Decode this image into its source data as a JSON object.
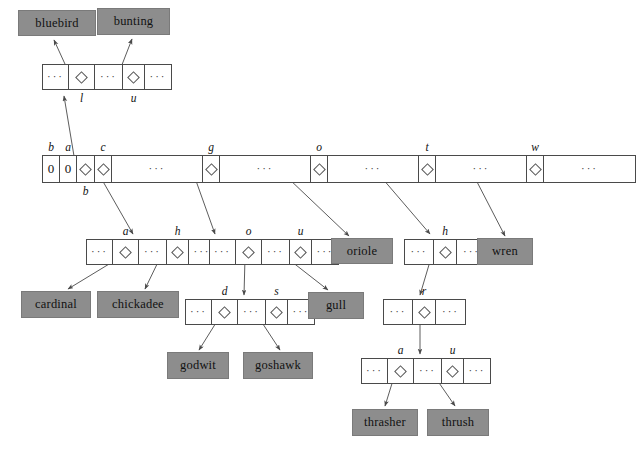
{
  "diagram": {
    "colors": {
      "leaf_fill": "#8d8d8d",
      "node_stroke": "#4a4a4a",
      "background": "#ffffff",
      "arrow": "#555555"
    },
    "ellipsis": "···",
    "zero": "0"
  },
  "leaves": [
    {
      "id": "bluebird",
      "label": "bluebird",
      "x": 18,
      "y": 10,
      "w": 78,
      "h": 26
    },
    {
      "id": "bunting",
      "label": "bunting",
      "x": 97,
      "y": 8,
      "w": 73,
      "h": 27
    },
    {
      "id": "oriole",
      "label": "oriole",
      "x": 331,
      "y": 238,
      "w": 62,
      "h": 26
    },
    {
      "id": "wren",
      "label": "wren",
      "x": 477,
      "y": 238,
      "w": 56,
      "h": 27
    },
    {
      "id": "cardinal",
      "label": "cardinal",
      "x": 21,
      "y": 291,
      "w": 70,
      "h": 27
    },
    {
      "id": "chickadee",
      "label": "chickadee",
      "x": 97,
      "y": 291,
      "w": 82,
      "h": 27
    },
    {
      "id": "gull",
      "label": "gull",
      "x": 308,
      "y": 292,
      "w": 56,
      "h": 27
    },
    {
      "id": "godwit",
      "label": "godwit",
      "x": 167,
      "y": 352,
      "w": 62,
      "h": 27
    },
    {
      "id": "goshawk",
      "label": "goshawk",
      "x": 243,
      "y": 352,
      "w": 70,
      "h": 27
    },
    {
      "id": "thrasher",
      "label": "thrasher",
      "x": 352,
      "y": 409,
      "w": 66,
      "h": 27
    },
    {
      "id": "thrush",
      "label": "thrush",
      "x": 427,
      "y": 409,
      "w": 62,
      "h": 27
    }
  ],
  "nodes": [
    {
      "id": "node-b",
      "x": 42,
      "y": 64,
      "h": 26,
      "cells": [
        {
          "type": "dots",
          "w": 26
        },
        {
          "type": "pointer",
          "w": 26,
          "label": "l",
          "label_pos": "below"
        },
        {
          "type": "dots",
          "w": 28
        },
        {
          "type": "pointer",
          "w": 22,
          "label": "u",
          "label_pos": "below"
        },
        {
          "type": "dots",
          "w": 26
        }
      ]
    },
    {
      "id": "node-root",
      "x": 42,
      "y": 155,
      "h": 28,
      "cells": [
        {
          "type": "zero",
          "w": 17,
          "label": "b",
          "label_pos": "above"
        },
        {
          "type": "zero",
          "w": 17,
          "label": "a",
          "label_pos": "above"
        },
        {
          "type": "pointer",
          "w": 18,
          "label": "b",
          "label_pos": "below"
        },
        {
          "type": "pointer",
          "w": 17,
          "label": "c",
          "label_pos": "above"
        },
        {
          "type": "dots",
          "w": 91
        },
        {
          "type": "pointer",
          "w": 17,
          "label": "g",
          "label_pos": "above"
        },
        {
          "type": "dots",
          "w": 91
        },
        {
          "type": "pointer",
          "w": 17,
          "label": "o",
          "label_pos": "above"
        },
        {
          "type": "dots",
          "w": 91
        },
        {
          "type": "pointer",
          "w": 17,
          "label": "t",
          "label_pos": "above"
        },
        {
          "type": "dots",
          "w": 91
        },
        {
          "type": "pointer",
          "w": 17,
          "label": "w",
          "label_pos": "above"
        },
        {
          "type": "dots",
          "w": 91
        }
      ]
    },
    {
      "id": "node-c",
      "x": 86,
      "y": 239,
      "h": 26,
      "cells": [
        {
          "type": "dots",
          "w": 26
        },
        {
          "type": "pointer",
          "w": 26,
          "label": "a",
          "label_pos": "above"
        },
        {
          "type": "dots",
          "w": 28
        },
        {
          "type": "pointer",
          "w": 22,
          "label": "h",
          "label_pos": "above"
        },
        {
          "type": "dots",
          "w": 26
        }
      ]
    },
    {
      "id": "node-g",
      "x": 209,
      "y": 239,
      "h": 26,
      "cells": [
        {
          "type": "dots",
          "w": 26
        },
        {
          "type": "pointer",
          "w": 26,
          "label": "o",
          "label_pos": "above"
        },
        {
          "type": "dots",
          "w": 28
        },
        {
          "type": "pointer",
          "w": 22,
          "label": "u",
          "label_pos": "above"
        },
        {
          "type": "dots",
          "w": 26
        }
      ]
    },
    {
      "id": "node-t",
      "x": 404,
      "y": 239,
      "h": 26,
      "cells": [
        {
          "type": "dots",
          "w": 29
        },
        {
          "type": "pointer",
          "w": 23,
          "label": "h",
          "label_pos": "above"
        },
        {
          "type": "dots",
          "w": 29
        }
      ]
    },
    {
      "id": "node-go",
      "x": 185,
      "y": 299,
      "h": 26,
      "cells": [
        {
          "type": "dots",
          "w": 26
        },
        {
          "type": "pointer",
          "w": 26,
          "label": "d",
          "label_pos": "above"
        },
        {
          "type": "dots",
          "w": 28
        },
        {
          "type": "pointer",
          "w": 22,
          "label": "s",
          "label_pos": "above"
        },
        {
          "type": "dots",
          "w": 26
        }
      ]
    },
    {
      "id": "node-th",
      "x": 383,
      "y": 299,
      "h": 26,
      "cells": [
        {
          "type": "dots",
          "w": 29
        },
        {
          "type": "pointer",
          "w": 23,
          "label": "r",
          "label_pos": "above"
        },
        {
          "type": "dots",
          "w": 29
        }
      ]
    },
    {
      "id": "node-thr",
      "x": 361,
      "y": 358,
      "h": 26,
      "cells": [
        {
          "type": "dots",
          "w": 26
        },
        {
          "type": "pointer",
          "w": 26,
          "label": "a",
          "label_pos": "above"
        },
        {
          "type": "dots",
          "w": 28
        },
        {
          "type": "pointer",
          "w": 22,
          "label": "u",
          "label_pos": "above"
        },
        {
          "type": "dots",
          "w": 26
        }
      ]
    }
  ],
  "edges": [
    {
      "id": "edge-b-to-node",
      "from": "root.b",
      "to": "node-b",
      "x1": 75,
      "y1": 162,
      "x2": 64,
      "y2": 96
    },
    {
      "id": "edge-l-to-bluebird",
      "from": "node-b.l",
      "to": "bluebird",
      "x1": 70,
      "y1": 75,
      "x2": 54,
      "y2": 40
    },
    {
      "id": "edge-u-to-bunting",
      "from": "node-b.u",
      "to": "bunting",
      "x1": 118,
      "y1": 75,
      "x2": 132,
      "y2": 39
    },
    {
      "id": "edge-c-to-node",
      "from": "root.c",
      "to": "node-c",
      "x1": 101,
      "y1": 178,
      "x2": 133,
      "y2": 234
    },
    {
      "id": "edge-g-to-node",
      "from": "root.g",
      "to": "node-g",
      "x1": 195,
      "y1": 178,
      "x2": 215,
      "y2": 234
    },
    {
      "id": "edge-o-to-oriole",
      "from": "root.o",
      "to": "oriole",
      "x1": 288,
      "y1": 178,
      "x2": 349,
      "y2": 236
    },
    {
      "id": "edge-t-to-node",
      "from": "root.t",
      "to": "node-t",
      "x1": 382,
      "y1": 178,
      "x2": 430,
      "y2": 234
    },
    {
      "id": "edge-w-to-wren",
      "from": "root.w",
      "to": "wren",
      "x1": 475,
      "y1": 178,
      "x2": 505,
      "y2": 236
    },
    {
      "id": "edge-a-to-cardinal",
      "from": "node-c.a",
      "to": "cardinal",
      "x1": 119,
      "y1": 258,
      "x2": 68,
      "y2": 289
    },
    {
      "id": "edge-h-to-chickadee",
      "from": "node-c.h",
      "to": "chickadee",
      "x1": 160,
      "y1": 258,
      "x2": 145,
      "y2": 289
    },
    {
      "id": "edge-go-to-node",
      "from": "node-g.o",
      "to": "node-go",
      "x1": 245,
      "y1": 258,
      "x2": 244,
      "y2": 295
    },
    {
      "id": "edge-gu-to-gull",
      "from": "node-g.u",
      "to": "gull",
      "x1": 287,
      "y1": 258,
      "x2": 328,
      "y2": 290
    },
    {
      "id": "edge-d-to-godwit",
      "from": "node-go.d",
      "to": "godwit",
      "x1": 219,
      "y1": 318,
      "x2": 199,
      "y2": 350
    },
    {
      "id": "edge-s-to-goshawk",
      "from": "node-go.s",
      "to": "goshawk",
      "x1": 259,
      "y1": 318,
      "x2": 280,
      "y2": 350
    },
    {
      "id": "edge-th-to-node",
      "from": "node-t.h",
      "to": "node-th",
      "x1": 431,
      "y1": 258,
      "x2": 420,
      "y2": 295
    },
    {
      "id": "edge-r-to-node",
      "from": "node-th.r",
      "to": "node-thr",
      "x1": 420,
      "y1": 318,
      "x2": 420,
      "y2": 354
    },
    {
      "id": "edge-a-to-thrasher",
      "from": "node-thr.a",
      "to": "thrasher",
      "x1": 394,
      "y1": 377,
      "x2": 385,
      "y2": 406
    },
    {
      "id": "edge-u-to-thrush",
      "from": "node-thr.u",
      "to": "thrush",
      "x1": 435,
      "y1": 377,
      "x2": 455,
      "y2": 406
    }
  ]
}
